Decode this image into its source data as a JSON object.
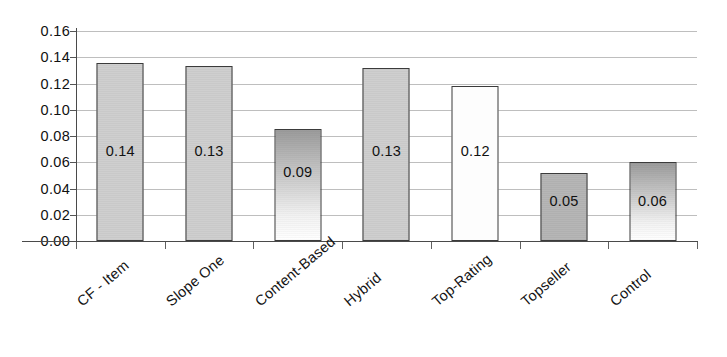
{
  "chart_data": {
    "type": "bar",
    "title": "",
    "subtitle": "",
    "xlabel": "",
    "ylabel": "",
    "categories": [
      "CF - Item",
      "Slope One",
      "Content-Based",
      "Hybrid",
      "Top-Rating",
      "Topseller",
      "Control"
    ],
    "values": [
      0.136,
      0.133,
      0.085,
      0.132,
      0.118,
      0.052,
      0.06
    ],
    "data_labels": [
      "0.14",
      "0.13",
      "0.09",
      "0.13",
      "0.12",
      "0.05",
      "0.06"
    ],
    "ylim": [
      0.0,
      0.16
    ],
    "ytick_step": 0.02,
    "ytick_labels": [
      "0.16",
      "0.14",
      "0.12",
      "0.10",
      "0.08",
      "0.06",
      "0.04",
      "0.02",
      "0.00"
    ],
    "ytick_values": [
      0.16,
      0.14,
      0.12,
      0.1,
      0.08,
      0.06,
      0.04,
      0.02,
      0.0
    ],
    "grid": true,
    "grid_axis": "y",
    "legend": false,
    "legend_position": "none",
    "bar_fills": [
      "light-gray",
      "light-gray",
      "gradient-gray-to-white",
      "light-gray",
      "white",
      "mid-gray",
      "gradient-gray-to-white"
    ],
    "xtick_label_rotation": -40
  },
  "colors": {
    "background": "#ffffff",
    "axis": "#4a4a4a",
    "gridline": "#b9b9b9",
    "bar_outline": "#3b3b3b",
    "bar_light_gray": "#cfcfcf",
    "bar_mid_gray": "#b6b6b6",
    "bar_white": "#fdfdfd",
    "text": "#111111"
  }
}
